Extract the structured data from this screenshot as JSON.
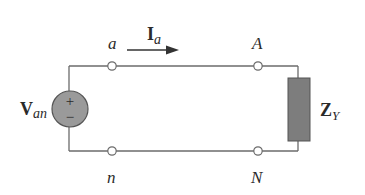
{
  "diagram": {
    "type": "circuit",
    "colors": {
      "wire": "#6b6b6b",
      "source_fill": "#9a9a9a",
      "impedance_fill": "#7d7d7d",
      "terminal_fill": "#ffffff",
      "text": "#2a2a2a"
    },
    "source": {
      "label_main": "V",
      "label_sub": "an",
      "plus": "+",
      "minus": "−"
    },
    "current": {
      "label_main": "I",
      "label_sub": "a"
    },
    "terminals": {
      "top_left": "a",
      "top_right": "A",
      "bottom_left": "n",
      "bottom_right": "N"
    },
    "load": {
      "label_main": "Z",
      "label_sub": "Y"
    }
  }
}
